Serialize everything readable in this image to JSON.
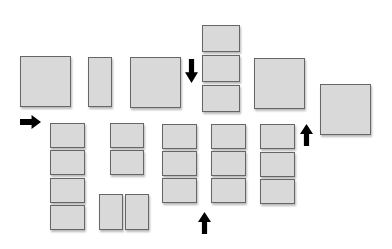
{
  "diagram": {
    "background": "#ffffff",
    "box_fill": "#d9d9d9",
    "box_border": "#666666",
    "arrow_color": "#000000",
    "boxes": [
      {
        "id": "large-box-1",
        "x": 20,
        "y": 56,
        "w": 51,
        "h": 51
      },
      {
        "id": "tall-box-2",
        "x": 88,
        "y": 57,
        "w": 24,
        "h": 50
      },
      {
        "id": "large-box-3",
        "x": 130,
        "y": 57,
        "w": 51,
        "h": 51
      },
      {
        "id": "stack-top-1",
        "x": 202,
        "y": 25,
        "w": 38,
        "h": 27
      },
      {
        "id": "stack-top-2",
        "x": 202,
        "y": 55,
        "w": 38,
        "h": 27
      },
      {
        "id": "stack-top-3",
        "x": 202,
        "y": 85,
        "w": 38,
        "h": 27
      },
      {
        "id": "large-box-4",
        "x": 254,
        "y": 58,
        "w": 51,
        "h": 51
      },
      {
        "id": "large-box-5",
        "x": 320,
        "y": 84,
        "w": 51,
        "h": 51
      },
      {
        "id": "col1-1",
        "x": 50,
        "y": 123,
        "w": 35,
        "h": 25
      },
      {
        "id": "col1-2",
        "x": 50,
        "y": 150,
        "w": 35,
        "h": 25
      },
      {
        "id": "col1-3",
        "x": 50,
        "y": 178,
        "w": 35,
        "h": 25
      },
      {
        "id": "col1-4",
        "x": 50,
        "y": 205,
        "w": 35,
        "h": 25
      },
      {
        "id": "col2-1",
        "x": 110,
        "y": 123,
        "w": 34,
        "h": 25
      },
      {
        "id": "col2-2",
        "x": 110,
        "y": 150,
        "w": 34,
        "h": 25
      },
      {
        "id": "pair-left",
        "x": 99,
        "y": 194,
        "w": 24,
        "h": 36
      },
      {
        "id": "pair-right",
        "x": 125,
        "y": 194,
        "w": 24,
        "h": 36
      },
      {
        "id": "col3-1",
        "x": 162,
        "y": 124,
        "w": 35,
        "h": 25
      },
      {
        "id": "col3-2",
        "x": 162,
        "y": 151,
        "w": 35,
        "h": 25
      },
      {
        "id": "col3-3",
        "x": 162,
        "y": 178,
        "w": 35,
        "h": 25
      },
      {
        "id": "col4-1",
        "x": 211,
        "y": 124,
        "w": 35,
        "h": 25
      },
      {
        "id": "col4-2",
        "x": 211,
        "y": 151,
        "w": 35,
        "h": 25
      },
      {
        "id": "col4-3",
        "x": 211,
        "y": 178,
        "w": 35,
        "h": 25
      },
      {
        "id": "col5-1",
        "x": 260,
        "y": 124,
        "w": 35,
        "h": 25
      },
      {
        "id": "col5-2",
        "x": 260,
        "y": 152,
        "w": 35,
        "h": 25
      },
      {
        "id": "col5-3",
        "x": 260,
        "y": 179,
        "w": 35,
        "h": 25
      }
    ],
    "arrows": [
      {
        "id": "arrow-right",
        "direction": "right",
        "x": 20,
        "y": 115,
        "w": 21,
        "h": 14
      },
      {
        "id": "arrow-down",
        "direction": "down",
        "x": 185,
        "y": 59,
        "w": 13,
        "h": 24
      },
      {
        "id": "arrow-up-mid",
        "direction": "up",
        "x": 198,
        "y": 212,
        "w": 13,
        "h": 22
      },
      {
        "id": "arrow-up-right",
        "direction": "up",
        "x": 300,
        "y": 124,
        "w": 13,
        "h": 22
      }
    ]
  }
}
